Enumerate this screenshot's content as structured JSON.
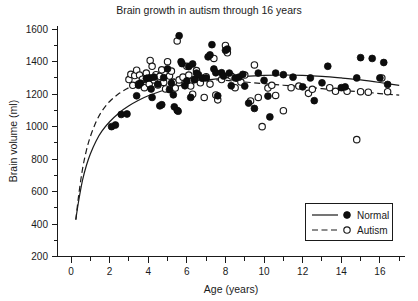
{
  "chart_data": {
    "type": "scatter",
    "title": "Brain growth in autism through 16 years",
    "xlabel": "Age (years)",
    "ylabel": "Brain volume (ml)",
    "xlim": [
      -0.7,
      17.3
    ],
    "ylim": [
      200,
      1620
    ],
    "grid": false,
    "x_ticks": [
      0,
      2,
      4,
      6,
      8,
      10,
      12,
      14,
      16
    ],
    "x_tick_labels": [
      "0",
      "2",
      "4",
      "6",
      "8",
      "10",
      "12",
      "14",
      "16"
    ],
    "x_minor_step": 1,
    "y_ticks": [
      200,
      400,
      600,
      800,
      1000,
      1200,
      1400,
      1600
    ],
    "y_tick_labels": [
      "200",
      "400",
      "600",
      "800",
      "1000",
      "1200",
      "1400",
      "1600"
    ],
    "y_minor_step": 100,
    "legend": {
      "position": "bottom-right",
      "entries": [
        {
          "name": "Normal",
          "marker": "filled-circle",
          "line": "solid"
        },
        {
          "name": "Autism",
          "marker": "open-circle",
          "line": "dashed"
        }
      ]
    },
    "series": [
      {
        "name": "Normal",
        "marker": "filled-circle",
        "points": [
          [
            2.1,
            1000
          ],
          [
            2.3,
            1010
          ],
          [
            2.6,
            1075
          ],
          [
            2.9,
            1078
          ],
          [
            3.4,
            1190
          ],
          [
            3.5,
            1255
          ],
          [
            3.6,
            1268
          ],
          [
            3.9,
            1297
          ],
          [
            4.1,
            1300
          ],
          [
            4.15,
            1232
          ],
          [
            4.2,
            1180
          ],
          [
            4.3,
            1305
          ],
          [
            4.5,
            1262
          ],
          [
            4.6,
            1128
          ],
          [
            4.7,
            1135
          ],
          [
            4.8,
            1302
          ],
          [
            5.0,
            1356
          ],
          [
            5.1,
            1228
          ],
          [
            5.2,
            1268
          ],
          [
            5.3,
            1196
          ],
          [
            5.35,
            1122
          ],
          [
            5.5,
            1100
          ],
          [
            5.55,
            1095
          ],
          [
            5.6,
            1560
          ],
          [
            5.7,
            1400
          ],
          [
            5.75,
            1388
          ],
          [
            5.9,
            1252
          ],
          [
            6.0,
            1282
          ],
          [
            6.1,
            1370
          ],
          [
            6.2,
            1180
          ],
          [
            6.3,
            1386
          ],
          [
            6.4,
            1290
          ],
          [
            6.5,
            1330
          ],
          [
            6.6,
            1320
          ],
          [
            6.8,
            1298
          ],
          [
            7.0,
            1300
          ],
          [
            7.1,
            1430
          ],
          [
            7.2,
            1442
          ],
          [
            7.3,
            1505
          ],
          [
            7.4,
            1355
          ],
          [
            7.5,
            1332
          ],
          [
            7.6,
            1190
          ],
          [
            7.8,
            1332
          ],
          [
            7.9,
            1312
          ],
          [
            8.0,
            1470
          ],
          [
            8.1,
            1478
          ],
          [
            8.2,
            1330
          ],
          [
            8.3,
            1252
          ],
          [
            8.5,
            1300
          ],
          [
            8.7,
            1305
          ],
          [
            8.9,
            1322
          ],
          [
            9.0,
            1250
          ],
          [
            9.2,
            1145
          ],
          [
            9.5,
            1112
          ],
          [
            9.7,
            1330
          ],
          [
            10.0,
            1285
          ],
          [
            10.2,
            1188
          ],
          [
            10.3,
            1060
          ],
          [
            10.6,
            1330
          ],
          [
            11.0,
            1320
          ],
          [
            11.5,
            1305
          ],
          [
            12.0,
            1245
          ],
          [
            12.4,
            1300
          ],
          [
            12.6,
            1160
          ],
          [
            13.0,
            1270
          ],
          [
            13.3,
            1372
          ],
          [
            14.0,
            1240
          ],
          [
            14.2,
            1245
          ],
          [
            14.8,
            1300
          ],
          [
            15.0,
            1425
          ],
          [
            15.6,
            1420
          ],
          [
            16.0,
            1300
          ],
          [
            16.2,
            1395
          ],
          [
            16.4,
            1260
          ]
        ]
      },
      {
        "name": "Autism",
        "marker": "open-circle",
        "points": [
          [
            3.0,
            1290
          ],
          [
            3.1,
            1322
          ],
          [
            3.2,
            1255
          ],
          [
            3.3,
            1315
          ],
          [
            3.4,
            1348
          ],
          [
            3.5,
            1262
          ],
          [
            3.55,
            1318
          ],
          [
            3.7,
            1292
          ],
          [
            3.8,
            1240
          ],
          [
            3.9,
            1330
          ],
          [
            4.0,
            1300
          ],
          [
            4.05,
            1262
          ],
          [
            4.1,
            1408
          ],
          [
            4.2,
            1372
          ],
          [
            4.3,
            1288
          ],
          [
            4.4,
            1320
          ],
          [
            4.5,
            1256
          ],
          [
            4.6,
            1310
          ],
          [
            4.7,
            1350
          ],
          [
            4.8,
            1272
          ],
          [
            4.9,
            1232
          ],
          [
            5.0,
            1400
          ],
          [
            5.1,
            1312
          ],
          [
            5.2,
            1342
          ],
          [
            5.3,
            1272
          ],
          [
            5.4,
            1238
          ],
          [
            5.5,
            1528
          ],
          [
            5.6,
            1288
          ],
          [
            5.8,
            1305
          ],
          [
            5.9,
            1260
          ],
          [
            6.0,
            1372
          ],
          [
            6.1,
            1318
          ],
          [
            6.2,
            1250
          ],
          [
            6.3,
            1200
          ],
          [
            6.4,
            1290
          ],
          [
            6.5,
            1345
          ],
          [
            6.7,
            1270
          ],
          [
            6.9,
            1180
          ],
          [
            7.0,
            1308
          ],
          [
            7.2,
            1262
          ],
          [
            7.4,
            1420
          ],
          [
            7.5,
            1195
          ],
          [
            7.6,
            1165
          ],
          [
            7.8,
            1290
          ],
          [
            8.0,
            1500
          ],
          [
            8.1,
            1455
          ],
          [
            8.3,
            1312
          ],
          [
            8.5,
            1240
          ],
          [
            8.8,
            1275
          ],
          [
            9.0,
            1318
          ],
          [
            9.3,
            1158
          ],
          [
            9.5,
            1380
          ],
          [
            9.7,
            1180
          ],
          [
            9.9,
            1000
          ],
          [
            10.2,
            1238
          ],
          [
            10.4,
            1255
          ],
          [
            10.6,
            1192
          ],
          [
            11.0,
            1098
          ],
          [
            11.4,
            1240
          ],
          [
            11.8,
            1250
          ],
          [
            12.3,
            1205
          ],
          [
            12.5,
            1230
          ],
          [
            13.4,
            1240
          ],
          [
            13.7,
            1218
          ],
          [
            14.3,
            1218
          ],
          [
            14.8,
            920
          ],
          [
            15.0,
            1215
          ],
          [
            15.4,
            1212
          ],
          [
            16.1,
            1300
          ],
          [
            16.4,
            1215
          ]
        ]
      }
    ],
    "fit_curves": [
      {
        "name": "Normal",
        "line": "solid",
        "points": [
          [
            0.25,
            430
          ],
          [
            0.4,
            545
          ],
          [
            0.6,
            672
          ],
          [
            0.8,
            762
          ],
          [
            1.0,
            832
          ],
          [
            1.3,
            912
          ],
          [
            1.6,
            972
          ],
          [
            2.0,
            1030
          ],
          [
            2.5,
            1086
          ],
          [
            3.0,
            1128
          ],
          [
            3.5,
            1162
          ],
          [
            4.0,
            1190
          ],
          [
            5.0,
            1232
          ],
          [
            6.0,
            1262
          ],
          [
            7.0,
            1285
          ],
          [
            8.0,
            1300
          ],
          [
            9.0,
            1310
          ],
          [
            10.0,
            1316
          ],
          [
            11.0,
            1318
          ],
          [
            12.0,
            1316
          ],
          [
            13.0,
            1310
          ],
          [
            14.0,
            1300
          ],
          [
            15.0,
            1288
          ],
          [
            16.0,
            1272
          ],
          [
            17.0,
            1254
          ]
        ]
      },
      {
        "name": "Autism",
        "line": "dashed",
        "points": [
          [
            0.25,
            425
          ],
          [
            0.4,
            580
          ],
          [
            0.6,
            742
          ],
          [
            0.8,
            855
          ],
          [
            1.0,
            938
          ],
          [
            1.3,
            1030
          ],
          [
            1.6,
            1095
          ],
          [
            2.0,
            1155
          ],
          [
            2.5,
            1205
          ],
          [
            3.0,
            1240
          ],
          [
            3.5,
            1262
          ],
          [
            4.0,
            1276
          ],
          [
            5.0,
            1292
          ],
          [
            6.0,
            1296
          ],
          [
            7.0,
            1292
          ],
          [
            8.0,
            1285
          ],
          [
            9.0,
            1275
          ],
          [
            10.0,
            1265
          ],
          [
            11.0,
            1255
          ],
          [
            12.0,
            1245
          ],
          [
            13.0,
            1234
          ],
          [
            14.0,
            1224
          ],
          [
            15.0,
            1214
          ],
          [
            16.0,
            1204
          ],
          [
            17.0,
            1194
          ]
        ]
      }
    ]
  }
}
